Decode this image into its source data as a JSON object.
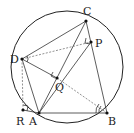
{
  "diagram": {
    "type": "geometry",
    "circle": {
      "cx": 67,
      "cy": 67,
      "r": 56
    },
    "points": [
      {
        "name": "C",
        "x": 86,
        "y": 21,
        "lx": 84,
        "ly": 14
      },
      {
        "name": "P",
        "x": 91,
        "y": 42,
        "lx": 96,
        "ly": 46
      },
      {
        "name": "D",
        "x": 22,
        "y": 59,
        "lx": 11,
        "ly": 62
      },
      {
        "name": "Q",
        "x": 57,
        "y": 78,
        "lx": 58,
        "ly": 90
      },
      {
        "name": "R",
        "x": 23,
        "y": 110,
        "lx": 17,
        "ly": 124
      },
      {
        "name": "A",
        "x": 39,
        "y": 113,
        "lx": 30,
        "ly": 124
      },
      {
        "name": "B",
        "x": 107,
        "y": 113,
        "lx": 109,
        "ly": 124
      }
    ],
    "labels": {
      "C": "C",
      "P": "P",
      "D": "D",
      "Q": "Q",
      "R": "R",
      "A": "A",
      "B": "B"
    },
    "solid_segments": [
      [
        "D",
        "C"
      ],
      [
        "C",
        "B"
      ],
      [
        "A",
        "B"
      ],
      [
        "D",
        "A"
      ],
      [
        "A",
        "C"
      ],
      [
        "A",
        "P"
      ],
      [
        "D",
        "Q"
      ],
      [
        "R",
        "A"
      ]
    ],
    "dashed_segments": [
      [
        "D",
        "P"
      ],
      [
        "Q",
        "B"
      ],
      [
        "D",
        "R"
      ]
    ]
  }
}
